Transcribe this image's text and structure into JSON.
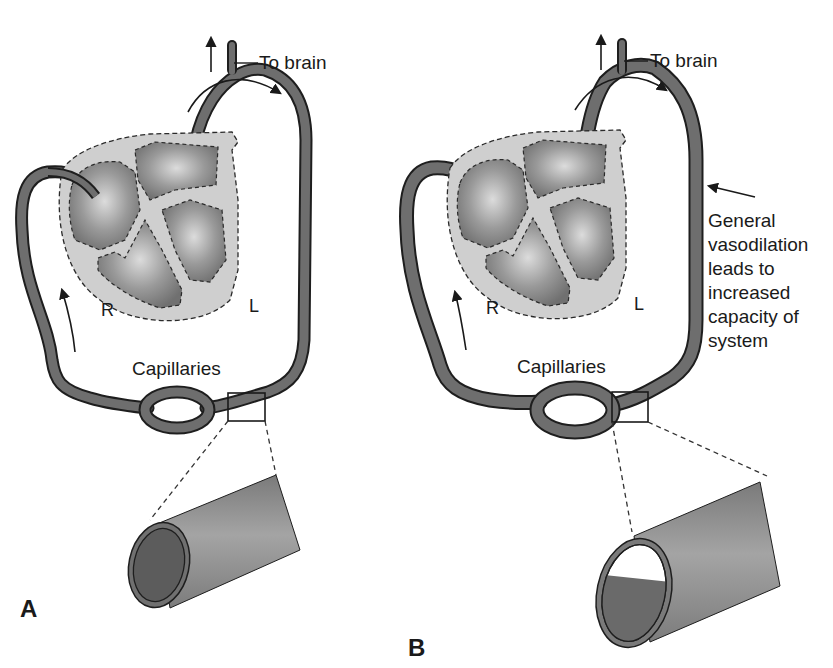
{
  "figure": {
    "panels": [
      {
        "id": "A",
        "panel_label": "A",
        "to_brain_label": "To brain",
        "right_label": "R",
        "left_label": "L",
        "capillaries_label": "Capillaries",
        "vessel_cross_section": "full"
      },
      {
        "id": "B",
        "panel_label": "B",
        "to_brain_label": "To brain",
        "right_label": "R",
        "left_label": "L",
        "capillaries_label": "Capillaries",
        "vessel_cross_section": "partially-filled",
        "annotation": "General vasodilation leads to increased capacity of system"
      }
    ],
    "colors": {
      "vessel_fill": "#6e6e6e",
      "vessel_outline": "#1e1e1e",
      "heart_outer": "#cfcfcf",
      "heart_chamber": "#8a8a8a",
      "chamber_highlight": "#d8d8d8",
      "tube_fill": "#8c8c8c"
    }
  }
}
